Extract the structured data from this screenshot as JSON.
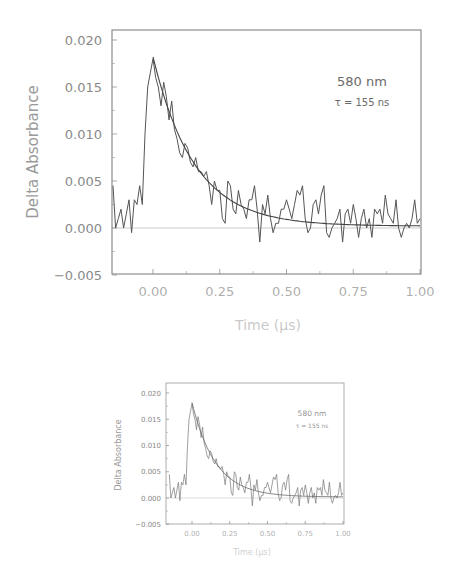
{
  "chart_data": [
    {
      "type": "line",
      "title": "",
      "xlabel": "Time (µs)",
      "ylabel": "Delta Absorbance",
      "xlim": [
        -0.15,
        1.0
      ],
      "ylim": [
        -0.005,
        0.02
      ],
      "grid": false,
      "x_ticks": [
        "0.00",
        "0.25",
        "0.50",
        "0.75",
        "1.00"
      ],
      "y_ticks": [
        "0.020",
        "0.015",
        "0.010",
        "0.005",
        "0.000",
        "-0.005"
      ],
      "annotations": [
        "580 nm",
        "τ = 155 ns"
      ],
      "zero_line": true,
      "series": [
        {
          "name": "measured",
          "x": [
            -0.15,
            -0.14,
            -0.13,
            -0.12,
            -0.11,
            -0.1,
            -0.09,
            -0.08,
            -0.07,
            -0.06,
            -0.05,
            -0.04,
            -0.03,
            -0.02,
            -0.01,
            0.0,
            0.01,
            0.02,
            0.03,
            0.04,
            0.05,
            0.06,
            0.07,
            0.08,
            0.09,
            0.1,
            0.11,
            0.12,
            0.13,
            0.14,
            0.15,
            0.16,
            0.17,
            0.18,
            0.19,
            0.2,
            0.21,
            0.22,
            0.23,
            0.24,
            0.25,
            0.26,
            0.27,
            0.28,
            0.29,
            0.3,
            0.31,
            0.32,
            0.33,
            0.34,
            0.35,
            0.36,
            0.37,
            0.38,
            0.39,
            0.4,
            0.41,
            0.42,
            0.43,
            0.44,
            0.45,
            0.46,
            0.47,
            0.48,
            0.49,
            0.5,
            0.51,
            0.52,
            0.53,
            0.54,
            0.55,
            0.56,
            0.57,
            0.58,
            0.59,
            0.6,
            0.61,
            0.62,
            0.63,
            0.64,
            0.65,
            0.66,
            0.67,
            0.68,
            0.69,
            0.7,
            0.71,
            0.72,
            0.73,
            0.74,
            0.75,
            0.76,
            0.77,
            0.78,
            0.79,
            0.8,
            0.81,
            0.82,
            0.83,
            0.84,
            0.85,
            0.86,
            0.87,
            0.88,
            0.89,
            0.9,
            0.91,
            0.92,
            0.93,
            0.94,
            0.95,
            0.96,
            0.97,
            0.98,
            0.99,
            1.0
          ],
          "y": [
            0.0045,
            0.0,
            0.001,
            0.002,
            0.0,
            0.0015,
            0.003,
            -0.0005,
            0.003,
            0.0025,
            0.0045,
            0.0025,
            0.01,
            0.015,
            0.0165,
            0.018,
            0.016,
            0.015,
            0.013,
            0.0155,
            0.014,
            0.0115,
            0.0135,
            0.0105,
            0.0095,
            0.008,
            0.0075,
            0.009,
            0.0085,
            0.007,
            0.0065,
            0.0075,
            0.006,
            0.006,
            0.0055,
            0.006,
            0.0045,
            0.0025,
            0.005,
            0.004,
            0.004,
            0.001,
            0.0005,
            0.005,
            0.0045,
            0.002,
            0.0015,
            0.004,
            0.0025,
            0.002,
            0.001,
            0.003,
            0.003,
            0.0045,
            0.002,
            -0.0015,
            0.0025,
            0.0015,
            0.0035,
            0.001,
            -0.0005,
            0.0005,
            0.0005,
            0.002,
            0.002,
            0.003,
            0.002,
            0.001,
            0.0025,
            0.004,
            0.0035,
            0.0045,
            0.001,
            -0.0005,
            0.0,
            0.0025,
            0.003,
            0.0015,
            0.0035,
            0.0045,
            -0.0005,
            -0.001,
            0.0,
            0.0005,
            0.001,
            0.002,
            -0.0015,
            0.0015,
            0.002,
            0.0005,
            0.0025,
            0.001,
            -0.001,
            0.001,
            0.002,
            0.0,
            0.001,
            -0.001,
            0.002,
            0.0015,
            0.002,
            0.0005,
            0.0035,
            0.0015,
            0.001,
            0.0005,
            0.003,
            0.0,
            -0.001,
            0.0,
            0.0005,
            0.0,
            0.001,
            0.003,
            0.0005,
            0.001,
            0.0
          ]
        },
        {
          "name": "exponential fit (τ = 155 ns)",
          "x0": 0.0,
          "amplitude": 0.018,
          "tau_us": 0.155,
          "offset": 0.0002,
          "x_range": [
            0.0,
            1.0
          ]
        }
      ]
    },
    {
      "type": "line",
      "note": "smaller duplicate of the same figure",
      "xlabel": "Time (µs)",
      "ylabel": "Delta Absorbance",
      "xlim": [
        -0.15,
        1.0
      ],
      "ylim": [
        -0.005,
        0.02
      ],
      "x_ticks": [
        "0.00",
        "0.25",
        "0.50",
        "0.75",
        "1.00"
      ],
      "y_ticks": [
        "0.020",
        "0.015",
        "0.010",
        "0.005",
        "0.000",
        "-0.005"
      ],
      "annotations": [
        "580 nm",
        "τ = 155 ns"
      ]
    }
  ],
  "figure": {
    "ylabel": "Delta Absorbance",
    "xlabel": "Time (µs)",
    "annotation_wavelength": "580 nm",
    "annotation_tau": "τ = 155 ns",
    "x_ticks": [
      "0.00",
      "0.25",
      "0.50",
      "0.75",
      "1.00"
    ],
    "y_ticks": [
      "0.020",
      "0.015",
      "0.010",
      "0.005",
      "0.000",
      "-0.005"
    ],
    "colors": {
      "trace": "#555555",
      "frame": "#777777",
      "text": "#8a8a8a"
    }
  }
}
